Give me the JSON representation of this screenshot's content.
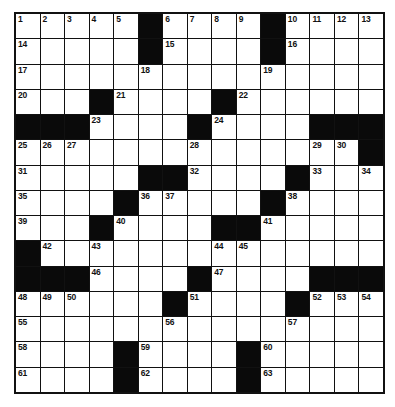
{
  "puzzle": {
    "type": "crossword",
    "size": {
      "rows": 15,
      "cols": 15
    },
    "colors": {
      "block": "#0a0a0a",
      "cell": "#ffffff",
      "line": "#111111"
    },
    "rows": [
      ".....#....#....",
      ".....#....#....",
      "...............",
      "...#....#......",
      "###....#....###",
      "..............#",
      ".....##....#...",
      "....#.....#....",
      "...#....##.....",
      "#..............",
      "###....#....###",
      "......#....#...",
      "...............",
      "....#....#.....",
      "....#....#....."
    ],
    "numbers": [
      {
        "r": 0,
        "c": 0,
        "n": "1"
      },
      {
        "r": 0,
        "c": 1,
        "n": "2"
      },
      {
        "r": 0,
        "c": 2,
        "n": "3"
      },
      {
        "r": 0,
        "c": 3,
        "n": "4"
      },
      {
        "r": 0,
        "c": 4,
        "n": "5"
      },
      {
        "r": 0,
        "c": 6,
        "n": "6"
      },
      {
        "r": 0,
        "c": 7,
        "n": "7"
      },
      {
        "r": 0,
        "c": 8,
        "n": "8"
      },
      {
        "r": 0,
        "c": 9,
        "n": "9"
      },
      {
        "r": 0,
        "c": 11,
        "n": "10"
      },
      {
        "r": 0,
        "c": 12,
        "n": "11"
      },
      {
        "r": 0,
        "c": 13,
        "n": "12"
      },
      {
        "r": 0,
        "c": 14,
        "n": "13"
      },
      {
        "r": 1,
        "c": 0,
        "n": "14"
      },
      {
        "r": 1,
        "c": 6,
        "n": "15"
      },
      {
        "r": 1,
        "c": 11,
        "n": "16"
      },
      {
        "r": 2,
        "c": 0,
        "n": "17"
      },
      {
        "r": 2,
        "c": 5,
        "n": "18"
      },
      {
        "r": 2,
        "c": 10,
        "n": "19"
      },
      {
        "r": 3,
        "c": 0,
        "n": "20"
      },
      {
        "r": 3,
        "c": 4,
        "n": "21"
      },
      {
        "r": 3,
        "c": 9,
        "n": "22"
      },
      {
        "r": 4,
        "c": 3,
        "n": "23"
      },
      {
        "r": 4,
        "c": 8,
        "n": "24"
      },
      {
        "r": 5,
        "c": 0,
        "n": "25"
      },
      {
        "r": 5,
        "c": 1,
        "n": "26"
      },
      {
        "r": 5,
        "c": 2,
        "n": "27"
      },
      {
        "r": 5,
        "c": 7,
        "n": "28"
      },
      {
        "r": 5,
        "c": 12,
        "n": "29"
      },
      {
        "r": 5,
        "c": 13,
        "n": "30"
      },
      {
        "r": 6,
        "c": 0,
        "n": "31"
      },
      {
        "r": 6,
        "c": 7,
        "n": "32"
      },
      {
        "r": 6,
        "c": 12,
        "n": "33"
      },
      {
        "r": 6,
        "c": 14,
        "n": "34"
      },
      {
        "r": 7,
        "c": 0,
        "n": "35"
      },
      {
        "r": 7,
        "c": 5,
        "n": "36"
      },
      {
        "r": 7,
        "c": 6,
        "n": "37"
      },
      {
        "r": 7,
        "c": 11,
        "n": "38"
      },
      {
        "r": 8,
        "c": 0,
        "n": "39"
      },
      {
        "r": 8,
        "c": 4,
        "n": "40"
      },
      {
        "r": 8,
        "c": 10,
        "n": "41"
      },
      {
        "r": 9,
        "c": 1,
        "n": "42"
      },
      {
        "r": 9,
        "c": 3,
        "n": "43"
      },
      {
        "r": 9,
        "c": 8,
        "n": "44"
      },
      {
        "r": 9,
        "c": 9,
        "n": "45"
      },
      {
        "r": 10,
        "c": 3,
        "n": "46"
      },
      {
        "r": 10,
        "c": 8,
        "n": "47"
      },
      {
        "r": 11,
        "c": 0,
        "n": "48"
      },
      {
        "r": 11,
        "c": 1,
        "n": "49"
      },
      {
        "r": 11,
        "c": 2,
        "n": "50"
      },
      {
        "r": 11,
        "c": 7,
        "n": "51"
      },
      {
        "r": 11,
        "c": 12,
        "n": "52"
      },
      {
        "r": 11,
        "c": 13,
        "n": "53"
      },
      {
        "r": 11,
        "c": 14,
        "n": "54"
      },
      {
        "r": 12,
        "c": 0,
        "n": "55"
      },
      {
        "r": 12,
        "c": 6,
        "n": "56"
      },
      {
        "r": 12,
        "c": 11,
        "n": "57"
      },
      {
        "r": 13,
        "c": 0,
        "n": "58"
      },
      {
        "r": 13,
        "c": 5,
        "n": "59"
      },
      {
        "r": 13,
        "c": 10,
        "n": "60"
      },
      {
        "r": 14,
        "c": 0,
        "n": "61"
      },
      {
        "r": 14,
        "c": 5,
        "n": "62"
      },
      {
        "r": 14,
        "c": 10,
        "n": "63"
      }
    ]
  }
}
